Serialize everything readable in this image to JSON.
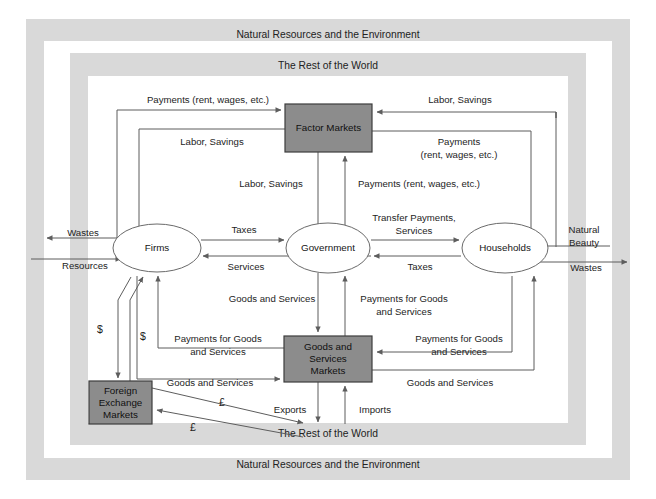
{
  "figure": {
    "background_color": "#ffffff",
    "band_color": "#d9d9d9",
    "inner_fill": "#ffffff",
    "box_fill": "#8c8c8c",
    "ellipse_fill": "#ffffff",
    "line_color": "#5d5d5d"
  },
  "frames": {
    "outer": {
      "label_top": "Natural Resources and the Environment",
      "label_bottom": "Natural Resources and the Environment"
    },
    "middle": {
      "label_top": "The Rest of the World",
      "label_bottom": "The Rest of the World"
    }
  },
  "nodes": {
    "factor_markets": {
      "label": "Factor Markets",
      "shape": "rect",
      "fill": "#8c8c8c"
    },
    "goods_markets": {
      "line1": "Goods and",
      "line2": "Services",
      "line3": "Markets",
      "shape": "rect",
      "fill": "#8c8c8c"
    },
    "foreign_exchange": {
      "line1": "Foreign",
      "line2": "Exchange",
      "line3": "Markets",
      "shape": "rect",
      "fill": "#8c8c8c"
    },
    "firms": {
      "label": "Firms",
      "shape": "ellipse",
      "fill": "#ffffff"
    },
    "government": {
      "label": "Government",
      "shape": "ellipse",
      "fill": "#ffffff"
    },
    "households": {
      "label": "Households",
      "shape": "ellipse",
      "fill": "#ffffff"
    }
  },
  "flows": {
    "firms_to_factor_payments": "Payments (rent, wages, etc.)",
    "factor_to_firms_labor": "Labor, Savings",
    "households_to_factor_labor": "Labor, Savings",
    "factor_to_households_payments_l1": "Payments",
    "factor_to_households_payments_l2": "(rent, wages, etc.)",
    "factor_to_government_labor": "Labor, Savings",
    "government_to_factor_payments": "Payments (rent, wages, etc.)",
    "firms_to_government_taxes": "Taxes",
    "government_to_firms_services": "Services",
    "government_to_households_transfer_l1": "Transfer Payments,",
    "government_to_households_transfer_l2": "Services",
    "households_to_government_taxes": "Taxes",
    "government_to_goods_gs": "Goods and Services",
    "goods_to_government_payments_l1": "Payments for Goods",
    "goods_to_government_payments_l2": "and Services",
    "goods_to_firms_payments_l1": "Payments for Goods",
    "goods_to_firms_payments_l2": "and Services",
    "households_to_goods_payments_l1": "Payments for Goods",
    "households_to_goods_payments_l2": "and Services",
    "firms_to_goods_gs": "Goods and Services",
    "goods_to_households_gs": "Goods and Services",
    "goods_exports": "Exports",
    "goods_imports": "Imports",
    "env_wastes_left": "Wastes",
    "env_resources_left": "Resources",
    "env_natural_beauty_l1": "Natural",
    "env_natural_beauty_l2": "Beauty",
    "env_wastes_right": "Wastes",
    "dollar_1": "$",
    "dollar_2": "$",
    "pound_1": "£",
    "pound_2": "£"
  }
}
